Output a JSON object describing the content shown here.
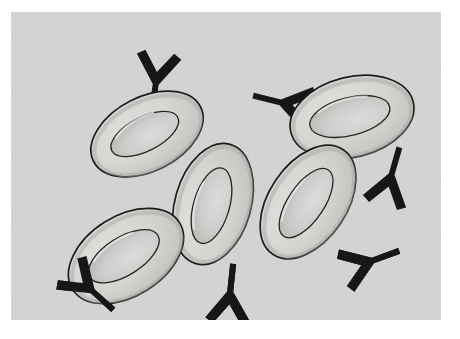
{
  "figure": {
    "kind": "scientific-illustration",
    "medium": "pen-and-ink halftone drawing",
    "caption": "",
    "canvas": {
      "width": 460,
      "height": 339
    },
    "panel": {
      "x": 11,
      "y": 12,
      "width": 430,
      "height": 308
    }
  },
  "colors": {
    "page_background": "#ffffff",
    "panel_background": "#d3d4d4",
    "cell_fill": "#cfd0cd",
    "cell_fill_light": "#dadbd8",
    "cell_rim_shade": "#b9bab6",
    "cell_outline": "#1b1b1b",
    "cell_inner_outline": "#2a2a2a",
    "antibody": "#151515",
    "stipple": "#4a4a4a"
  },
  "legend": {
    "cell_label": "red blood cell",
    "antibody_label": "antibody",
    "cell_icon": "ellipse-biconcave-icon",
    "antibody_icon": "antibody-y-icon"
  },
  "cells": [
    {
      "id": "cell-1",
      "name": "red-blood-cell-upper-left",
      "cx": 136,
      "cy": 122,
      "rx": 60,
      "ry": 37,
      "rotation": -27,
      "inner_rx": 37,
      "inner_ry": 17,
      "inner_rotation": -27,
      "shade_side": "lower-left"
    },
    {
      "id": "cell-2",
      "name": "red-blood-cell-upper-right",
      "cx": 341,
      "cy": 105,
      "rx": 63,
      "ry": 40,
      "rotation": -14,
      "inner_rx": 41,
      "inner_ry": 19,
      "inner_rotation": -14,
      "shade_side": "lower-left"
    },
    {
      "id": "cell-3",
      "name": "red-blood-cell-center",
      "cx": 202,
      "cy": 192,
      "rx": 62,
      "ry": 38,
      "rotation": -74,
      "inner_rx": 39,
      "inner_ry": 18,
      "inner_rotation": -74,
      "shade_side": "lower-left"
    },
    {
      "id": "cell-4",
      "name": "red-blood-cell-center-right",
      "cx": 297,
      "cy": 190,
      "rx": 63,
      "ry": 39,
      "rotation": -56,
      "inner_rx": 40,
      "inner_ry": 18,
      "inner_rotation": -56,
      "shade_side": "lower-left"
    },
    {
      "id": "cell-5",
      "name": "red-blood-cell-lower-left",
      "cx": 115,
      "cy": 244,
      "rx": 63,
      "ry": 40,
      "rotation": -32,
      "inner_rx": 40,
      "inner_ry": 19,
      "inner_rotation": -32,
      "shade_side": "lower-left"
    }
  ],
  "antibodies": [
    {
      "id": "ab-1",
      "name": "antibody-top-center",
      "x": 142,
      "y": 70,
      "scale": 1.0,
      "rotation": 8,
      "attached_to": "cell-1"
    },
    {
      "id": "ab-2",
      "name": "antibody-upper-right-left-of-cell",
      "x": 272,
      "y": 88,
      "scale": 1.0,
      "rotation": 104,
      "attached_to": "cell-2"
    },
    {
      "id": "ab-3",
      "name": "antibody-right-below-cell",
      "x": 383,
      "y": 165,
      "scale": 1.0,
      "rotation": 196,
      "attached_to": "cell-2"
    },
    {
      "id": "ab-4",
      "name": "antibody-right-lower",
      "x": 361,
      "y": 252,
      "scale": 1.0,
      "rotation": 250,
      "attached_to": "cell-4"
    },
    {
      "id": "ab-5",
      "name": "antibody-bottom-center",
      "x": 222,
      "y": 282,
      "scale": 1.0,
      "rotation": 186,
      "attached_to": "cell-3"
    },
    {
      "id": "ab-6",
      "name": "antibody-lower-left",
      "x": 78,
      "y": 280,
      "scale": 1.0,
      "rotation": 312,
      "attached_to": "cell-5"
    }
  ]
}
